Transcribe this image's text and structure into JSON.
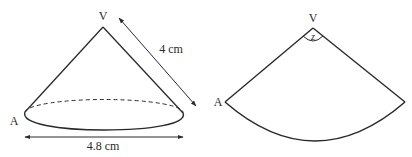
{
  "figure": {
    "cone": {
      "apex_label": "V",
      "base_point_label": "A",
      "slant_height_label": "4 cm",
      "diameter_label": "4.8 cm"
    },
    "net": {
      "apex_label": "V",
      "edge_point_label": "A",
      "angle_label": "z"
    },
    "colors": {
      "stroke": "#2a2a2a",
      "background": "#ffffff"
    }
  }
}
